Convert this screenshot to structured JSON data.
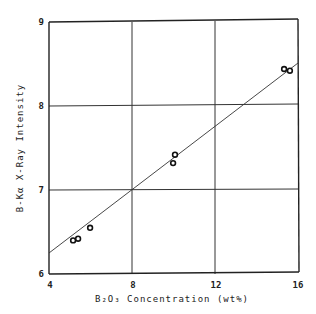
{
  "chart_data": {
    "type": "scatter",
    "title": "",
    "xlabel": "B2O3 Concentration (wt%)",
    "ylabel": "B-Kα X-Ray Intensity",
    "xlim": [
      4,
      16
    ],
    "ylim": [
      6,
      9
    ],
    "xticks": [
      "4",
      "8",
      "12",
      "16"
    ],
    "yticks": [
      "6",
      "7",
      "8",
      "9"
    ],
    "grid": true,
    "legend": null,
    "series": [
      {
        "name": "measured",
        "marker": "open-circle",
        "points": [
          {
            "x": 5.16,
            "y": 6.4
          },
          {
            "x": 5.4,
            "y": 6.42
          },
          {
            "x": 5.98,
            "y": 6.55
          },
          {
            "x": 9.98,
            "y": 7.32
          },
          {
            "x": 10.07,
            "y": 7.42
          },
          {
            "x": 15.33,
            "y": 8.44
          },
          {
            "x": 15.61,
            "y": 8.42
          }
        ]
      },
      {
        "name": "fit line",
        "type": "line",
        "points": [
          {
            "x": 4,
            "y": 6.17
          },
          {
            "x": 16,
            "y": 8.51
          }
        ]
      }
    ]
  },
  "labels": {
    "x_axis": "B₂O₃ Concentration (wt%)",
    "y_axis": "B-Kα X-Ray Intensity",
    "xtick_0": "4",
    "xtick_1": "8",
    "xtick_2": "12",
    "xtick_3": "16",
    "ytick_0": "6",
    "ytick_1": "7",
    "ytick_2": "8",
    "ytick_3": "9"
  }
}
